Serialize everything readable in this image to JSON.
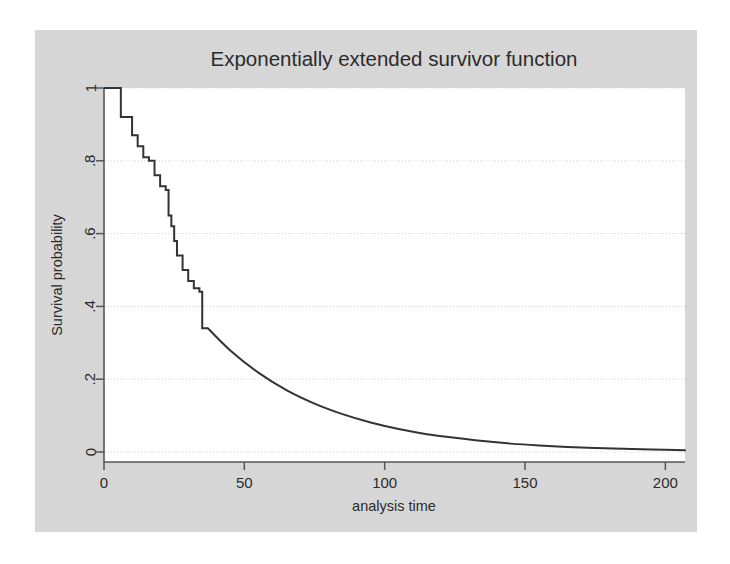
{
  "figure": {
    "background_color": "#d8d8d8",
    "plot_area_color": "#ffffff",
    "page_color": "#ffffff",
    "line_color": "#333333",
    "grid_color": "#d0d0d0",
    "axis_color": "#555555"
  },
  "chart_data": {
    "type": "line",
    "title": "Exponentially extended survivor function",
    "xlabel": "analysis time",
    "ylabel": "Survival probability",
    "xlim": [
      0,
      207
    ],
    "ylim": [
      0,
      1
    ],
    "xticks": [
      0,
      50,
      100,
      150,
      200
    ],
    "xtick_labels": [
      "0",
      "50",
      "100",
      "150",
      "200"
    ],
    "yticks": [
      0,
      0.2,
      0.4,
      0.6,
      0.8,
      1
    ],
    "ytick_labels": [
      "0",
      ".2",
      ".4",
      ".6",
      ".8",
      "1"
    ],
    "grid": "horizontal",
    "legend": "none",
    "series": [
      {
        "name": "Kaplan-Meier step segment",
        "style": "step-post",
        "x": [
          0,
          5,
          6,
          8,
          10,
          12,
          14,
          16,
          18,
          20,
          22,
          23,
          24,
          25,
          26,
          28,
          30,
          32,
          34,
          35,
          37
        ],
        "y": [
          1.0,
          1.0,
          0.92,
          0.92,
          0.87,
          0.84,
          0.81,
          0.8,
          0.76,
          0.73,
          0.72,
          0.65,
          0.62,
          0.58,
          0.54,
          0.5,
          0.47,
          0.45,
          0.44,
          0.34,
          0.34
        ]
      },
      {
        "name": "Exponential extension",
        "style": "smooth",
        "x": [
          37,
          45,
          55,
          65,
          75,
          85,
          95,
          105,
          115,
          125,
          135,
          145,
          155,
          165,
          175,
          185,
          195,
          207
        ],
        "y": [
          0.34,
          0.279,
          0.218,
          0.17,
          0.133,
          0.104,
          0.081,
          0.063,
          0.049,
          0.039,
          0.03,
          0.023,
          0.018,
          0.014,
          0.011,
          0.009,
          0.007,
          0.005
        ]
      }
    ]
  }
}
